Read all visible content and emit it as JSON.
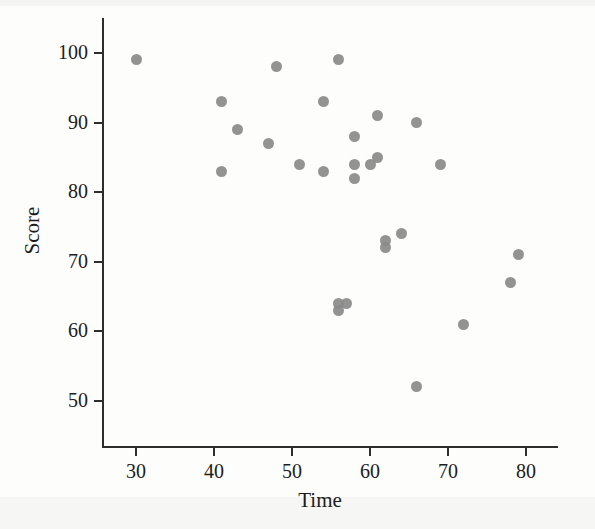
{
  "chart_data": {
    "type": "scatter",
    "title": "",
    "xlabel": "Time",
    "ylabel": "Score",
    "xlim": [
      25,
      84
    ],
    "ylim": [
      47,
      104
    ],
    "xticks": [
      30,
      40,
      50,
      60,
      70,
      80
    ],
    "yticks": [
      50,
      60,
      70,
      80,
      90,
      100
    ],
    "grid": false,
    "legend": null,
    "marker": {
      "shape": "circle",
      "color": "#8a8a8a",
      "size": 11
    },
    "x": [
      30,
      41,
      41,
      43,
      47,
      48,
      51,
      54,
      54,
      56,
      56,
      56,
      57,
      58,
      58,
      58,
      60,
      61,
      61,
      62,
      62,
      64,
      66,
      66,
      69,
      72,
      78,
      79
    ],
    "y": [
      99,
      93,
      83,
      89,
      87,
      98,
      84,
      93,
      83,
      99,
      64,
      63,
      64,
      88,
      82,
      84,
      84,
      91,
      85,
      73,
      72,
      74,
      90,
      52,
      84,
      61,
      67,
      71
    ],
    "points": [
      {
        "x": 30,
        "y": 99
      },
      {
        "x": 41,
        "y": 93
      },
      {
        "x": 41,
        "y": 83
      },
      {
        "x": 43,
        "y": 89
      },
      {
        "x": 47,
        "y": 87
      },
      {
        "x": 48,
        "y": 98
      },
      {
        "x": 51,
        "y": 84
      },
      {
        "x": 54,
        "y": 93
      },
      {
        "x": 54,
        "y": 83
      },
      {
        "x": 56,
        "y": 99
      },
      {
        "x": 56,
        "y": 64
      },
      {
        "x": 56,
        "y": 63
      },
      {
        "x": 57,
        "y": 64
      },
      {
        "x": 58,
        "y": 88
      },
      {
        "x": 58,
        "y": 82
      },
      {
        "x": 58,
        "y": 84
      },
      {
        "x": 60,
        "y": 84
      },
      {
        "x": 61,
        "y": 91
      },
      {
        "x": 61,
        "y": 85
      },
      {
        "x": 62,
        "y": 73
      },
      {
        "x": 62,
        "y": 72
      },
      {
        "x": 64,
        "y": 74
      },
      {
        "x": 66,
        "y": 90
      },
      {
        "x": 66,
        "y": 52
      },
      {
        "x": 69,
        "y": 84
      },
      {
        "x": 72,
        "y": 61
      },
      {
        "x": 78,
        "y": 67
      },
      {
        "x": 79,
        "y": 71
      }
    ],
    "n_points": 28
  },
  "axes": {
    "y_title": "Score",
    "x_title": "Time",
    "y_tick_labels": [
      "100",
      "90",
      "80",
      "70",
      "60",
      "50"
    ],
    "x_tick_labels": [
      "30",
      "40",
      "50",
      "60",
      "70",
      "80"
    ]
  },
  "colors": {
    "marker": "#8a8a8a",
    "axis": "#2e2e2e",
    "text": "#1c1c1c",
    "background": "#fdfdfc"
  }
}
